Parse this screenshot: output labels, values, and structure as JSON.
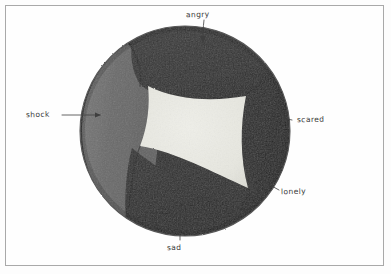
{
  "image": {
    "kind": "hand-drawn-marker-illustration",
    "subject": "sphere divided into labelled emotion segments",
    "background_color": "#fdfdfd",
    "frame_color": "#a9a9a9",
    "ink_color": "#3a3a3a"
  },
  "ball": {
    "center_x": 185,
    "center_y": 131,
    "radius_x": 105,
    "radius_y": 105,
    "outline_color": "#4a4a4a",
    "segments": [
      {
        "id": "shock",
        "label": "shock",
        "color": "#6e6e6e",
        "position": "left"
      },
      {
        "id": "angry",
        "label": "angry",
        "color": "#343434",
        "position": "top"
      },
      {
        "id": "scared",
        "label": "scared",
        "color": "#2a2a2a",
        "position": "right"
      },
      {
        "id": "lonely",
        "label": "lonely",
        "color": "#262626",
        "position": "lower-right"
      },
      {
        "id": "sad",
        "label": "sad",
        "color": "#2d2d2d",
        "position": "bottom"
      },
      {
        "id": "center",
        "label": "",
        "color": "#e9e9e3",
        "position": "center-face"
      }
    ]
  },
  "labels": [
    {
      "id": "angry",
      "text": "angry",
      "leader": "arrow-down"
    },
    {
      "id": "shock",
      "text": "shock",
      "leader": "line-right-arrow"
    },
    {
      "id": "scared",
      "text": "scared",
      "leader": "line-left"
    },
    {
      "id": "lonely",
      "text": "lonely",
      "leader": "line-up-left"
    },
    {
      "id": "sad",
      "text": "sad",
      "leader": "line-up"
    }
  ]
}
